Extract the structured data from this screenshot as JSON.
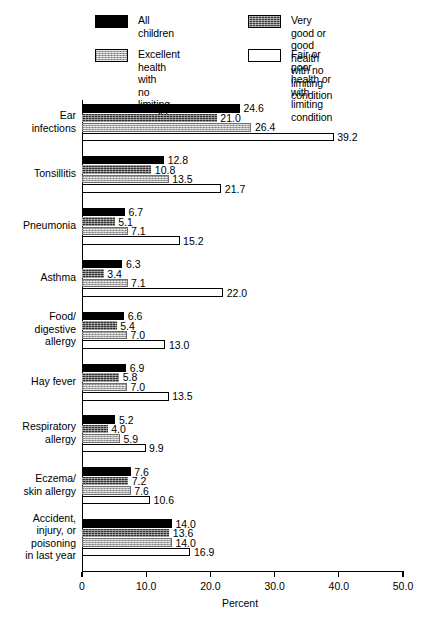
{
  "chart_data": {
    "type": "bar",
    "orientation": "horizontal",
    "title": "",
    "xlabel": "Percent",
    "ylabel": "",
    "xlim": [
      0,
      53
    ],
    "grid": false,
    "legend_position": "top",
    "xticks": [
      "0",
      "10.0",
      "20.0",
      "30.0",
      "40.0",
      "50.0"
    ],
    "xtick_values": [
      0,
      10,
      20,
      30,
      40,
      50
    ],
    "categories": [
      "Ear\ninfections",
      "Tonsillitis",
      "Pneumonia",
      "Asthma",
      "Food/\ndigestive\nallergy",
      "Hay fever",
      "Respiratory\nallergy",
      "Eczema/\nskin allergy",
      "Accident,\ninjury, or\npoisoning\nin last year"
    ],
    "series": [
      {
        "name": "All children",
        "key": "all",
        "swatch": "solid-black",
        "values": [
          24.6,
          12.8,
          6.7,
          6.3,
          6.6,
          6.9,
          5.2,
          7.6,
          14.0
        ],
        "labels": [
          "24.6",
          "12.8",
          "6.7",
          "6.3",
          "6.6",
          "6.9",
          "5.2",
          "7.6",
          "14.0"
        ]
      },
      {
        "name": "Very good or good health\nwith no limiting condition",
        "key": "verygood",
        "swatch": "dark-hatch",
        "values": [
          21.0,
          10.8,
          5.1,
          3.4,
          5.4,
          5.8,
          4.0,
          7.2,
          13.6
        ],
        "labels": [
          "21.0",
          "10.8",
          "5.1",
          "3.4",
          "5.4",
          "5.8",
          "4.0",
          "7.2",
          "13.6"
        ]
      },
      {
        "name": "Excellent health with\nno limiting condition",
        "key": "excellent",
        "swatch": "gray-stipple",
        "values": [
          26.4,
          13.5,
          7.1,
          7.1,
          7.0,
          7.0,
          5.9,
          7.6,
          14.0
        ],
        "labels": [
          "26.4",
          "13.5",
          "7.1",
          "7.1",
          "7.0",
          "7.0",
          "5.9",
          "7.6",
          "14.0"
        ]
      },
      {
        "name": "Fair or poor health or\nwith limiting condition",
        "key": "fair",
        "swatch": "white-outline",
        "values": [
          39.2,
          21.7,
          15.2,
          22.0,
          13.0,
          13.5,
          9.9,
          10.6,
          16.9
        ],
        "labels": [
          "39.2",
          "21.7",
          "15.2",
          "22.0",
          "13.0",
          "13.5",
          "9.9",
          "10.6",
          "16.9"
        ]
      }
    ]
  },
  "legend": {
    "items": [
      {
        "label": "All children",
        "swatch": "solid-black"
      },
      {
        "label": "Very good or good health\nwith no limiting condition",
        "swatch": "dark-hatch"
      },
      {
        "label": "Excellent health with\nno limiting condition",
        "swatch": "gray-stipple"
      },
      {
        "label": "Fair or poor health or\nwith limiting condition",
        "swatch": "white-outline"
      }
    ]
  }
}
